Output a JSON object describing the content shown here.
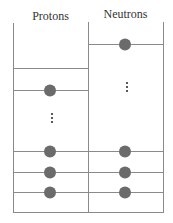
{
  "diagram": {
    "columns": [
      {
        "label": "Protons"
      },
      {
        "label": "Neutrons"
      }
    ],
    "ellipsis": "⋮",
    "colors": {
      "line": "#8a8a8a",
      "ball": "#6b6b6b"
    }
  }
}
